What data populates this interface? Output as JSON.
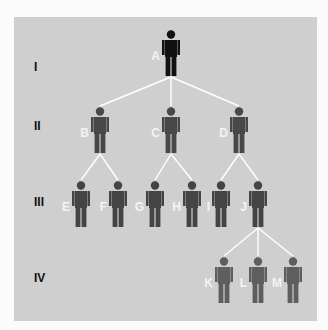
{
  "diagram": {
    "type": "family-tree-pedigree",
    "colors": {
      "background_panel": "#cfcfcf",
      "connector": "#ffffff",
      "gen1": "#111111",
      "gen2": "#484848",
      "gen3": "#444444",
      "gen4": "#5e5e5e",
      "letters": "#f4f4f4"
    },
    "generations": [
      {
        "label": "I",
        "y": 67
      },
      {
        "label": "II",
        "y": 126
      },
      {
        "label": "III",
        "y": 202
      },
      {
        "label": "IV",
        "y": 278
      }
    ],
    "people": [
      {
        "id": "A",
        "gen": 0,
        "x": 171,
        "y": 30
      },
      {
        "id": "B",
        "gen": 1,
        "x": 100,
        "y": 107
      },
      {
        "id": "C",
        "gen": 1,
        "x": 171,
        "y": 107
      },
      {
        "id": "D",
        "gen": 1,
        "x": 239,
        "y": 107
      },
      {
        "id": "E",
        "gen": 2,
        "x": 81,
        "y": 181
      },
      {
        "id": "F",
        "gen": 2,
        "x": 118,
        "y": 181
      },
      {
        "id": "G",
        "gen": 2,
        "x": 155,
        "y": 181
      },
      {
        "id": "H",
        "gen": 2,
        "x": 192,
        "y": 181
      },
      {
        "id": "I",
        "gen": 2,
        "x": 221,
        "y": 181
      },
      {
        "id": "J",
        "gen": 2,
        "x": 258,
        "y": 181
      },
      {
        "id": "K",
        "gen": 3,
        "x": 224,
        "y": 257
      },
      {
        "id": "L",
        "gen": 3,
        "x": 258,
        "y": 257
      },
      {
        "id": "M",
        "gen": 3,
        "x": 293,
        "y": 257
      }
    ],
    "edges": [
      [
        "A",
        "B"
      ],
      [
        "A",
        "C"
      ],
      [
        "A",
        "D"
      ],
      [
        "B",
        "E"
      ],
      [
        "B",
        "F"
      ],
      [
        "C",
        "G"
      ],
      [
        "C",
        "H"
      ],
      [
        "D",
        "I"
      ],
      [
        "D",
        "J"
      ],
      [
        "J",
        "K"
      ],
      [
        "J",
        "L"
      ],
      [
        "J",
        "M"
      ]
    ]
  }
}
